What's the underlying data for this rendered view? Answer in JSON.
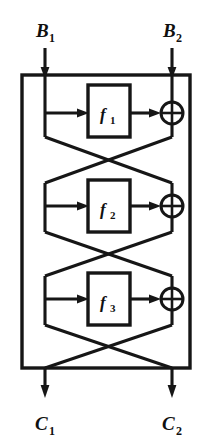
{
  "figure": {
    "kind": "feistel-network-diagram",
    "title": "",
    "background_color": "#ffffff",
    "line_color": "#161616",
    "inputs": [
      {
        "id": "B1",
        "base": "B",
        "sub": "1",
        "x": 45,
        "label_x": 45,
        "label_y": 30
      },
      {
        "id": "B2",
        "base": "B",
        "sub": "2",
        "x": 172,
        "label_x": 172,
        "label_y": 30
      }
    ],
    "outputs": [
      {
        "id": "C1",
        "base": "C",
        "sub": "1",
        "x": 45,
        "label_x": 45,
        "label_y": 430
      },
      {
        "id": "C2",
        "base": "C",
        "sub": "2",
        "x": 172,
        "label_x": 172,
        "label_y": 430
      }
    ],
    "outer_box": {
      "x": 22,
      "y": 75,
      "width": 168,
      "height": 293
    },
    "left_rail_x": 45,
    "right_rail_x": 172,
    "rounds": [
      {
        "index": 1,
        "function_base": "f",
        "function_sub": "1",
        "box": {
          "x": 88,
          "y": 85,
          "width": 42,
          "height": 52
        },
        "mid_y": 113,
        "xor": {
          "cx": 172,
          "cy": 113,
          "r": 11
        },
        "cross_top_y": 137,
        "cross_bottom_y": 183
      },
      {
        "index": 2,
        "function_base": "f",
        "function_sub": "2",
        "box": {
          "x": 88,
          "y": 180,
          "width": 42,
          "height": 52
        },
        "mid_y": 206,
        "xor": {
          "cx": 172,
          "cy": 206,
          "r": 11
        },
        "cross_top_y": 232,
        "cross_bottom_y": 276
      },
      {
        "index": 3,
        "function_base": "f",
        "function_sub": "3",
        "box": {
          "x": 88,
          "y": 273,
          "width": 42,
          "height": 52
        },
        "mid_y": 299,
        "xor": {
          "cx": 172,
          "cy": 299,
          "r": 11
        },
        "cross_top_y": 325,
        "cross_bottom_y": 368
      }
    ],
    "crossover_mid_x": 108
  }
}
